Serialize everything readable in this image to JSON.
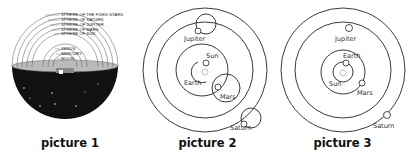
{
  "pictures": [
    {
      "caption": "picture 1",
      "model": "geocentric-spheres",
      "sphere_labels": [
        "SPHERE OF THE FIXED STARS",
        "SPHERE OF SATURN",
        "SPHERE OF JUPITER",
        "SPHERE OF MARS",
        "SPHERE OF SUN",
        "VENUS",
        "MERCURY",
        "MOON"
      ]
    },
    {
      "caption": "picture 2",
      "model": "tychonic",
      "labels": {
        "jupiter": "Jupiter",
        "sun": "Sun",
        "earth": "Earth",
        "mars": "Mars",
        "saturn": "Saturn"
      }
    },
    {
      "caption": "picture 3",
      "model": "heliocentric",
      "labels": {
        "jupiter": "Jupiter",
        "earth": "Earth",
        "sun": "Sun",
        "mars": "Mars",
        "saturn": "Saturn"
      }
    }
  ]
}
